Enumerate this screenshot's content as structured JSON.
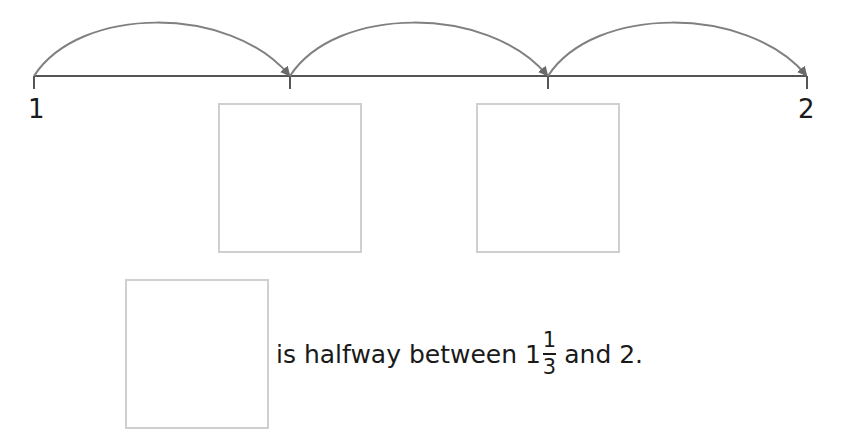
{
  "number_line": {
    "start_label": "1",
    "end_label": "2",
    "ticks": 4,
    "jumps": 3,
    "line_color": "#555555",
    "arc_color": "#808080"
  },
  "answer_boxes": {
    "count": 3,
    "border_color": "#cfcfcf"
  },
  "sentence": {
    "prefix": "is halfway between ",
    "whole": "1",
    "numerator": "1",
    "denominator": "3",
    "suffix": "and 2."
  }
}
